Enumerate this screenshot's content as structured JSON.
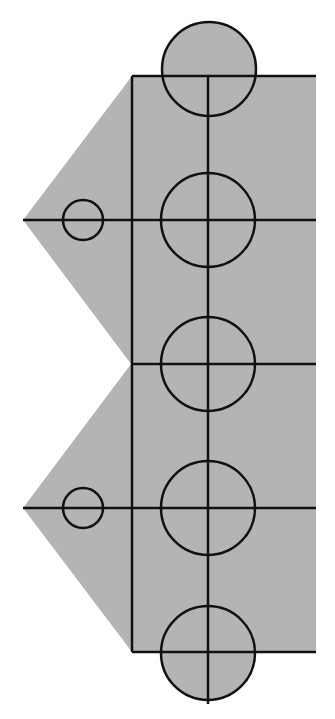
{
  "diagram": {
    "fill_color": "#b4b4b4",
    "stroke_color": "#111111",
    "stroke_width": 2.5,
    "gray_shape_points": "132,76 316,76 316,652 132,652 23,508 131,364 23,220",
    "main_vertical_line": {
      "x": 208,
      "y1": 76,
      "y2": 704
    },
    "left_vertical_line": {
      "x": 132,
      "y1": 76,
      "y2": 652
    },
    "horizontal_lines": [
      {
        "x1": 132,
        "y1": 76,
        "x2": 316,
        "y2": 76
      },
      {
        "x1": 23,
        "y1": 220,
        "x2": 316,
        "y2": 220
      },
      {
        "x1": 132,
        "y1": 364,
        "x2": 316,
        "y2": 364
      },
      {
        "x1": 23,
        "y1": 508,
        "x2": 316,
        "y2": 508
      },
      {
        "x1": 132,
        "y1": 652,
        "x2": 316,
        "y2": 652
      }
    ],
    "large_circles": [
      {
        "cx": 209,
        "cy": 69,
        "r": 47
      },
      {
        "cx": 208,
        "cy": 220,
        "r": 47
      },
      {
        "cx": 208,
        "cy": 364,
        "r": 47
      },
      {
        "cx": 208,
        "cy": 508,
        "r": 47
      },
      {
        "cx": 208,
        "cy": 653,
        "r": 47
      }
    ],
    "small_circles": [
      {
        "cx": 83,
        "cy": 220,
        "r": 20
      },
      {
        "cx": 83,
        "cy": 508,
        "r": 20
      }
    ]
  }
}
